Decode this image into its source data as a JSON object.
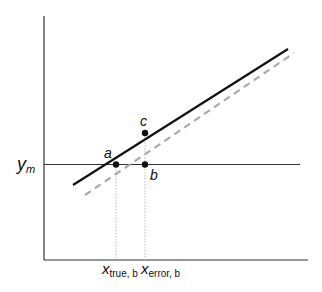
{
  "diagram": {
    "y_axis_label": "y",
    "y_axis_label_sub": "m",
    "point_a_label": "a",
    "point_b_label": "b",
    "point_c_label": "c",
    "x_true_label": "x",
    "x_true_sub": "true, b",
    "x_error_label": "x",
    "x_error_sub": "error, b",
    "colors": {
      "solid_line": "#111111",
      "dashed_line": "#aaaaaa",
      "axis": "#333333",
      "guide": "#bbbbbb"
    }
  }
}
